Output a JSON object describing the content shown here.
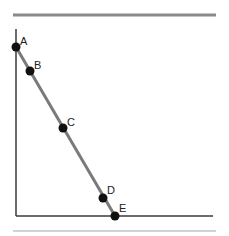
{
  "diagram": {
    "type": "line-on-axes",
    "colors": {
      "top_rule": "#8a8a8a",
      "bottom_rule": "#c4c4c4",
      "axes": "#3a3a3a",
      "segment": "#7a7a7a",
      "points": "#111111",
      "labels": "#222222"
    },
    "top_rule": {
      "x1": 13,
      "x2": 216,
      "y": 15
    },
    "bottom_rule": {
      "x1": 13,
      "x2": 216,
      "y": 231
    },
    "axes": {
      "origin": {
        "x": 16,
        "y": 216
      },
      "y_axis_top": 29,
      "x_axis_right": 213
    },
    "segment": {
      "from": "A",
      "to": "E"
    },
    "points": [
      {
        "label": "A",
        "x": 16,
        "y": 47,
        "lx": 20,
        "ly": 45
      },
      {
        "label": "B",
        "x": 30,
        "y": 71,
        "lx": 34,
        "ly": 69
      },
      {
        "label": "C",
        "x": 63,
        "y": 128,
        "lx": 67,
        "ly": 126
      },
      {
        "label": "D",
        "x": 103,
        "y": 198,
        "lx": 107,
        "ly": 194
      },
      {
        "label": "E",
        "x": 115,
        "y": 216,
        "lx": 119,
        "ly": 212
      }
    ]
  }
}
